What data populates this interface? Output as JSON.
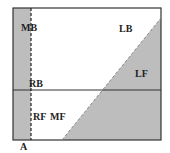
{
  "diagram": {
    "labels": {
      "mb": "MB",
      "lb": "LB",
      "rb": "RB",
      "lf": "LF",
      "rf": "RF",
      "mf": "MF",
      "a": "A"
    },
    "colors": {
      "shade": "#bdbdbd",
      "line": "#333333",
      "background": "#ffffff"
    }
  }
}
